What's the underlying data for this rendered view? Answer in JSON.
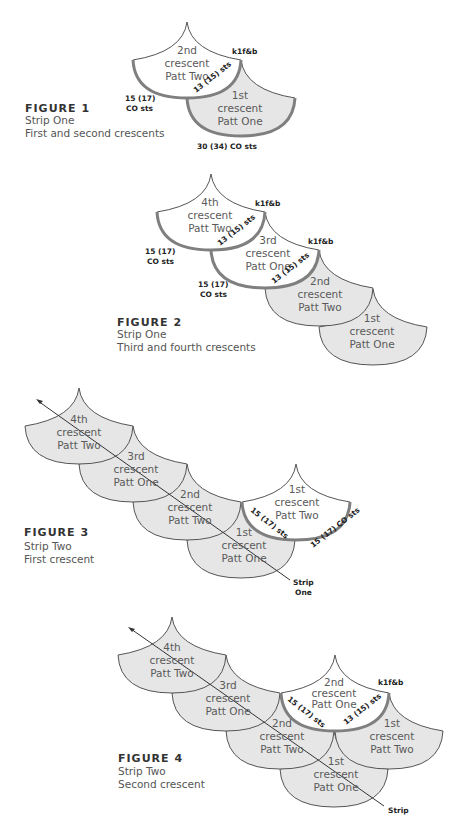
{
  "colors": {
    "fill_gray": "#e6e6e6",
    "fill_white": "#ffffff",
    "outline": "#555555",
    "highlight": "#7f7f7f",
    "text": "#5a5a5a",
    "label": "#222222"
  },
  "figures": [
    {
      "title": "FIGURE 1",
      "lines": [
        "Strip One",
        "First and second crescents"
      ],
      "scales": [
        {
          "label": [
            "1st",
            "crescent",
            "Patt One"
          ]
        },
        {
          "label": [
            "2nd",
            "crescent",
            "Patt Two"
          ]
        }
      ],
      "labels": {
        "k1fb": "k1f&b",
        "edge": "13 (15) sts",
        "co_left": [
          "15 (17)",
          "CO sts"
        ],
        "co_bottom": "30 (34) CO sts"
      }
    },
    {
      "title": "FIGURE 2",
      "lines": [
        "Strip One",
        "Third and fourth crescents"
      ],
      "scales": [
        {
          "label": [
            "1st",
            "crescent",
            "Patt One"
          ]
        },
        {
          "label": [
            "2nd",
            "crescent",
            "Patt Two"
          ]
        },
        {
          "label": [
            "3rd",
            "crescent",
            "Patt One"
          ]
        },
        {
          "label": [
            "4th",
            "crescent",
            "Patt Two"
          ]
        }
      ],
      "labels": {
        "k1fb_a": "k1f&b",
        "k1fb_b": "k1f&b",
        "edge_a": "13 (15) sts",
        "edge_b": "13 (15) sts",
        "co_a": [
          "15 (17)",
          "CO sts"
        ],
        "co_b": [
          "15 (17)",
          "CO sts"
        ]
      }
    },
    {
      "title": "FIGURE 3",
      "lines": [
        "Strip Two",
        "First crescent"
      ],
      "scales": [
        {
          "label": [
            "1st",
            "crescent",
            "Patt One"
          ]
        },
        {
          "label": [
            "2nd",
            "crescent",
            "Patt Two"
          ]
        },
        {
          "label": [
            "3rd",
            "crescent",
            "Patt One"
          ]
        },
        {
          "label": [
            "4th",
            "crescent",
            "Patt Two"
          ]
        },
        {
          "label": [
            "1st",
            "crescent",
            "Patt Two"
          ]
        }
      ],
      "labels": {
        "edge": "15 (17) sts",
        "co": "15 (17) CO sts",
        "strip": [
          "Strip",
          "One"
        ]
      }
    },
    {
      "title": "FIGURE 4",
      "lines": [
        "Strip Two",
        "Second crescent"
      ],
      "scales": [
        {
          "label": [
            "1st",
            "crescent",
            "Patt One"
          ]
        },
        {
          "label": [
            "2nd",
            "crescent",
            "Patt Two"
          ]
        },
        {
          "label": [
            "3rd",
            "crescent",
            "Patt One"
          ]
        },
        {
          "label": [
            "4th",
            "crescent",
            "Patt Two"
          ]
        },
        {
          "label": [
            "1st",
            "crescent",
            "Patt Two"
          ]
        },
        {
          "label": [
            "2nd",
            "crescent",
            "Patt One"
          ]
        }
      ],
      "labels": {
        "k1fb": "k1f&b",
        "edge_left": "15 (17) sts",
        "edge_right": "13 (15) sts",
        "strip": "Strip"
      }
    }
  ]
}
